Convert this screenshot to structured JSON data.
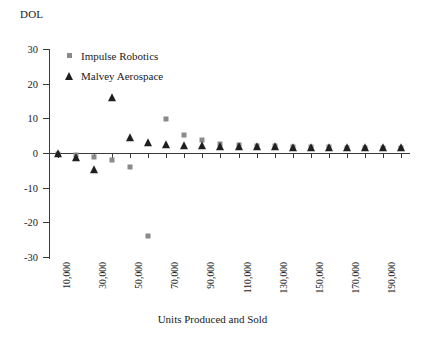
{
  "chart_data": {
    "type": "scatter",
    "title": "",
    "ylabel": "DOL",
    "xlabel": "Units Produced and Sold",
    "ylim": [
      -30,
      30
    ],
    "yticks": [
      30,
      20,
      10,
      0,
      -10,
      -20,
      -30
    ],
    "ytick_labels": [
      "30",
      "20",
      "10",
      "0",
      "-10",
      "-20",
      "-30"
    ],
    "xlim": [
      5000,
      205000
    ],
    "xtick_labels": [
      "10,000",
      "30,000",
      "50,000",
      "70,000",
      "90,000",
      "110,000",
      "130,000",
      "150,000",
      "170,000",
      "190,000"
    ],
    "xtick_values": [
      10000,
      30000,
      50000,
      70000,
      90000,
      110000,
      130000,
      150000,
      170000,
      190000
    ],
    "x": [
      10000,
      20000,
      30000,
      40000,
      50000,
      60000,
      70000,
      80000,
      90000,
      100000,
      110000,
      120000,
      130000,
      140000,
      150000,
      160000,
      170000,
      180000,
      190000,
      200000
    ],
    "grid": false,
    "legend_position": "upper-left",
    "series": [
      {
        "name": "Impulse Robotics",
        "marker": "square",
        "color": "#8a8a8a",
        "values": [
          -0.3,
          -0.6,
          -1.2,
          -2.0,
          -4.0,
          -24.0,
          9.8,
          5.2,
          3.7,
          2.6,
          2.3,
          2.1,
          1.9,
          1.8,
          1.7,
          1.6,
          1.5,
          1.5,
          1.4,
          1.4
        ]
      },
      {
        "name": "Malvey Aerospace",
        "marker": "triangle",
        "color": "#1f1f1f",
        "values": [
          -0.4,
          -1.5,
          -5.0,
          15.8,
          4.3,
          3.0,
          2.4,
          2.1,
          1.9,
          1.8,
          1.7,
          1.6,
          1.6,
          1.5,
          1.5,
          1.4,
          1.4,
          1.4,
          1.3,
          1.3
        ]
      }
    ]
  },
  "legend": {
    "items": [
      {
        "label": "Impulse Robotics",
        "marker": "square"
      },
      {
        "label": "Malvey Aerospace",
        "marker": "triangle"
      }
    ]
  }
}
